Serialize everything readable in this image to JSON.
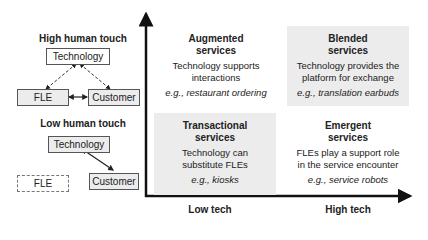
{
  "left_panel": {
    "high_touch": {
      "heading": "High human touch",
      "nodes": {
        "technology": "Technology",
        "fle": "FLE",
        "customer": "Customer"
      }
    },
    "low_touch": {
      "heading": "Low human touch",
      "nodes": {
        "technology": "Technology",
        "fle": "FLE",
        "customer": "Customer"
      }
    }
  },
  "quadrants": {
    "augmented": {
      "title_line1": "Augmented",
      "title_line2": "services",
      "desc_line1": "Technology supports",
      "desc_line2": "interactions",
      "example": "e.g., restaurant ordering"
    },
    "blended": {
      "title_line1": "Blended",
      "title_line2": "services",
      "desc_line1": "Technology provides the",
      "desc_line2": "platform for exchange",
      "example": "e.g., translation earbuds"
    },
    "transactional": {
      "title_line1": "Transactional",
      "title_line2": "services",
      "desc_line1": "Technology can",
      "desc_line2": "substitute FLEs",
      "example": "e.g., kiosks"
    },
    "emergent": {
      "title_line1": "Emergent",
      "title_line2": "services",
      "desc_line1": "FLEs play a support role",
      "desc_line2": "in the service encounter",
      "example": "e.g., service robots"
    }
  },
  "axes": {
    "x_low": "Low tech",
    "x_high": "High tech"
  },
  "colors": {
    "shaded_fill": "#ececec",
    "axis": "#111111"
  }
}
